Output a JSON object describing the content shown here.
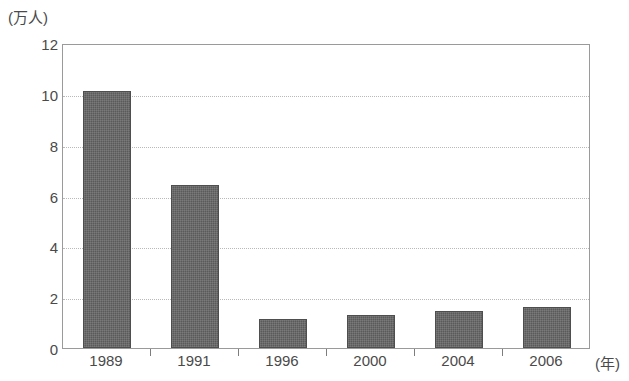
{
  "chart_data": {
    "type": "bar",
    "title": "",
    "categories": [
      "1989",
      "1991",
      "1996",
      "2000",
      "2004",
      "2006"
    ],
    "values": [
      10.1,
      6.4,
      1.15,
      1.3,
      1.45,
      1.6
    ],
    "series": [
      {
        "name": "",
        "values": [
          10.1,
          6.4,
          1.15,
          1.3,
          1.45,
          1.6
        ]
      }
    ],
    "xlabel": "(年)",
    "ylabel": "(万人)",
    "ylim": [
      0,
      12
    ],
    "yticks": [
      0,
      2,
      4,
      6,
      8,
      10,
      12
    ],
    "ytick_labels": [
      "0",
      "2",
      "4",
      "6",
      "8",
      "10",
      "12"
    ],
    "grid": true,
    "grid_axis": "y",
    "grid_style": "dotted",
    "legend": false,
    "bar_color": "#5a5a5a",
    "frame_color": "#9a9a9a",
    "gridline_color": "#b9b9b9"
  },
  "axes": {
    "y_unit_label": "(万人)",
    "x_unit_label": "(年)"
  },
  "caption": {
    "text": ""
  }
}
